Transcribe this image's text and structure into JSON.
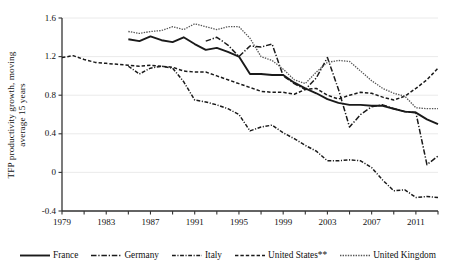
{
  "figure": {
    "ylabel_line1": "TFP productivity growth, moving",
    "ylabel_line2": "average 15 years"
  },
  "axis": {
    "y_ticks": [
      "1.6",
      "1.2",
      "0.8",
      "0.4",
      "0",
      "-0.4"
    ],
    "x_ticks": [
      "1979",
      "1983",
      "1987",
      "1991",
      "1995",
      "1999",
      "2003",
      "2007",
      "2011"
    ]
  },
  "legend": {
    "items": [
      {
        "label": "France",
        "style": "solid",
        "color": "#1a1a1a",
        "width": 1.9
      },
      {
        "label": "Germany",
        "style": "dashdot",
        "color": "#1a1a1a",
        "width": 1.6
      },
      {
        "label": "Italy",
        "style": "dashdot2",
        "color": "#1a1a1a",
        "width": 1.6
      },
      {
        "label": "United States**",
        "style": "dashed",
        "color": "#1a1a1a",
        "width": 1.6
      },
      {
        "label": "United Kingdom",
        "style": "dotted",
        "color": "#555555",
        "width": 1.4
      }
    ]
  },
  "chart_data": {
    "type": "line",
    "title": "",
    "xlabel": "",
    "ylabel": "TFP productivity growth, moving average 15 years",
    "xlim": [
      1979,
      2013
    ],
    "ylim": [
      -0.4,
      1.6
    ],
    "grid": "horizontal",
    "legend_position": "bottom",
    "x_tick_step": 4,
    "x_minor_tick_step": 2,
    "series": [
      {
        "name": "France",
        "style": "solid",
        "color": "#1a1a1a",
        "x": [
          1985,
          1986,
          1987,
          1988,
          1989,
          1990,
          1991,
          1992,
          1993,
          1994,
          1995,
          1996,
          1997,
          1998,
          1999,
          2000,
          2001,
          2002,
          2003,
          2004,
          2005,
          2006,
          2007,
          2008,
          2009,
          2010,
          2011,
          2012,
          2013
        ],
        "y": [
          1.38,
          1.36,
          1.41,
          1.37,
          1.35,
          1.4,
          1.33,
          1.27,
          1.29,
          1.25,
          1.2,
          1.02,
          1.02,
          1.01,
          1.01,
          0.93,
          0.87,
          0.82,
          0.76,
          0.72,
          0.7,
          0.7,
          0.69,
          0.69,
          0.66,
          0.63,
          0.62,
          0.55,
          0.5
        ]
      },
      {
        "name": "Germany",
        "style": "dashdot",
        "color": "#1a1a1a",
        "x": [
          1992,
          1993,
          1994,
          1995,
          1996,
          1997,
          1998,
          1999,
          2000,
          2001,
          2002,
          2003,
          2004,
          2005,
          2006,
          2007,
          2008,
          2009,
          2010,
          2011,
          2012,
          2013
        ],
        "y": [
          1.36,
          1.4,
          1.32,
          1.2,
          1.31,
          1.3,
          1.33,
          1.0,
          0.92,
          0.86,
          0.98,
          1.19,
          0.86,
          0.47,
          0.6,
          0.68,
          0.7,
          0.66,
          0.63,
          0.62,
          0.08,
          0.17
        ]
      },
      {
        "name": "Italy",
        "style": "dashdot2",
        "color": "#1a1a1a",
        "x": [
          1985,
          1986,
          1987,
          1988,
          1989,
          1990,
          1991,
          1992,
          1993,
          1994,
          1995,
          1996,
          1997,
          1998,
          1999,
          2000,
          2001,
          2002,
          2003,
          2004,
          2005,
          2006,
          2007,
          2008,
          2009,
          2010,
          2011,
          2012,
          2013
        ],
        "y": [
          1.1,
          1.02,
          1.08,
          1.1,
          1.08,
          0.94,
          0.75,
          0.73,
          0.7,
          0.66,
          0.6,
          0.43,
          0.47,
          0.49,
          0.41,
          0.35,
          0.28,
          0.22,
          0.12,
          0.12,
          0.13,
          0.12,
          0.05,
          -0.08,
          -0.19,
          -0.18,
          -0.26,
          -0.25,
          -0.26
        ]
      },
      {
        "name": "United States**",
        "style": "dashed",
        "color": "#1a1a1a",
        "x": [
          1979,
          1980,
          1981,
          1982,
          1983,
          1984,
          1985,
          1986,
          1987,
          1988,
          1989,
          1990,
          1991,
          1992,
          1993,
          1994,
          1995,
          1996,
          1997,
          1998,
          1999,
          2000,
          2001,
          2002,
          2003,
          2004,
          2005,
          2006,
          2007,
          2008,
          2009,
          2010,
          2011,
          2012,
          2013
        ],
        "y": [
          1.19,
          1.21,
          1.17,
          1.14,
          1.13,
          1.12,
          1.11,
          1.1,
          1.11,
          1.1,
          1.09,
          1.05,
          1.04,
          1.04,
          1.0,
          0.96,
          0.92,
          0.88,
          0.84,
          0.83,
          0.83,
          0.81,
          0.86,
          0.87,
          0.8,
          0.76,
          0.8,
          0.83,
          0.82,
          0.78,
          0.75,
          0.79,
          0.87,
          0.96,
          1.08
        ]
      },
      {
        "name": "United Kingdom",
        "style": "dotted",
        "color": "#555555",
        "x": [
          1985,
          1986,
          1987,
          1988,
          1989,
          1990,
          1991,
          1992,
          1993,
          1994,
          1995,
          1996,
          1997,
          1998,
          1999,
          2000,
          2001,
          2002,
          2003,
          2004,
          2005,
          2006,
          2007,
          2008,
          2009,
          2010,
          2011,
          2012,
          2013
        ],
        "y": [
          1.46,
          1.44,
          1.46,
          1.47,
          1.51,
          1.48,
          1.54,
          1.51,
          1.48,
          1.51,
          1.51,
          1.39,
          1.2,
          1.16,
          1.07,
          0.96,
          0.92,
          1.04,
          1.14,
          1.16,
          1.15,
          1.05,
          0.95,
          0.87,
          0.82,
          0.79,
          0.67,
          0.66,
          0.66
        ]
      }
    ]
  }
}
